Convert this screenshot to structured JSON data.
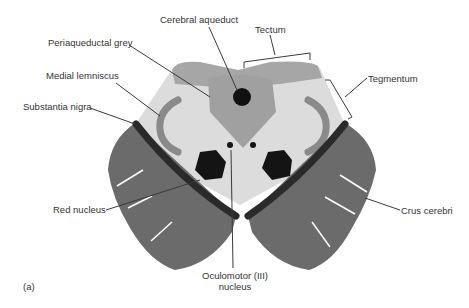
{
  "figure": {
    "panel_label": "(a)"
  },
  "labels": {
    "cerebral_aqueduct": "Cerebral aqueduct",
    "tectum": "Tectum",
    "periaqueductal_grey": "Periaqueductal grey",
    "tegmentum": "Tegmentum",
    "medial_lemniscus": "Medial lemniscus",
    "substantia_nigra": "Substantia nigra",
    "red_nucleus": "Red nucleus",
    "crus_cerebri": "Crus cerebri",
    "oculomotor_line1": "Oculomotor (III)",
    "oculomotor_line2": "nucleus"
  },
  "colors": {
    "tegmentum_fill": "#dcdcdc",
    "tectum_fill": "#a6a6a6",
    "periaqueductal_fill": "#a0a0a0",
    "lemniscus_fill": "#8a8a8a",
    "crus_fill": "#6b6b6b",
    "nigra_fill": "#2a2a2a",
    "nucleus_fill": "#141414",
    "leader_line": "#3a3a3a"
  }
}
